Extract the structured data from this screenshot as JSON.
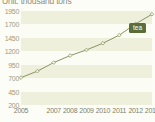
{
  "chart_title": "Unit: thousand tons",
  "legend": {
    "badge_label": "tea",
    "badge_color": "#5b6e37",
    "badge_text_color": "#ffffff"
  },
  "axes": {
    "y_ticks": [
      "1950",
      "1700",
      "1450",
      "1200",
      "950",
      "700",
      "450",
      "200"
    ],
    "x_ticks": [
      "2005",
      "2007",
      "2008",
      "2009",
      "2010",
      "2011",
      "2012",
      "2013"
    ]
  },
  "colors": {
    "line": "#8a9463",
    "marker_fill": "#f5f6ea",
    "marker_stroke": "#8a9463",
    "band_dark": "#eef0dc",
    "band_light": "#fbfcf3",
    "axis_text": "#7d7f6a",
    "title_text": "#8d8f7c"
  },
  "chart_data": {
    "type": "line",
    "title": "Unit: thousand tons",
    "xlabel": "",
    "ylabel": "thousand tons",
    "ylim": [
      200,
      1950
    ],
    "y_tick_step": 250,
    "grid": "horizontal-bands",
    "legend_position": "inline-right",
    "x": [
      2005,
      2006,
      2007,
      2008,
      2009,
      2010,
      2011,
      2012,
      2013
    ],
    "x_tick_labels": [
      "2005",
      "2007",
      "2008",
      "2009",
      "2010",
      "2011",
      "2012",
      "2013"
    ],
    "series": [
      {
        "name": "tea",
        "values": [
          710,
          830,
          990,
          1120,
          1225,
          1350,
          1500,
          1710,
          1890
        ]
      }
    ]
  }
}
